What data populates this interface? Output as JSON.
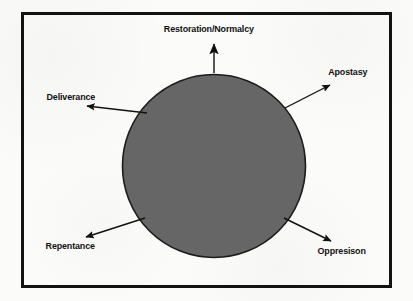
{
  "figure": {
    "type": "cycle-diagram",
    "center_shape": {
      "name": "central-circle",
      "shape": "circle",
      "fill_color": "#666666",
      "stroke_color": "#1a1a1a",
      "center_x": 214,
      "center_y": 166,
      "radius": 92
    },
    "frame": {
      "border_color": "#121212",
      "background_color": "#fbfbf9"
    },
    "arrows": [
      {
        "id": "restoration",
        "label": "Restoration/Normalcy",
        "direction": "up",
        "angle_deg": 90,
        "x1": 214,
        "y1": 72,
        "x2": 214,
        "y2": 41
      },
      {
        "id": "apostasy",
        "label": "Apostasy",
        "direction": "up-right",
        "angle_deg": 40,
        "x1": 286,
        "y1": 107,
        "x2": 333,
        "y2": 83
      },
      {
        "id": "oppresison",
        "label": "Oppresison",
        "direction": "down-right",
        "angle_deg": -40,
        "x1": 285,
        "y1": 219,
        "x2": 334,
        "y2": 243
      },
      {
        "id": "repentance",
        "label": "Repentance",
        "direction": "down-left",
        "angle_deg": -140,
        "x1": 143,
        "y1": 219,
        "x2": 83,
        "y2": 238
      },
      {
        "id": "deliverance",
        "label": "Deliverance",
        "direction": "up-left",
        "angle_deg": 140,
        "x1": 145,
        "y1": 112,
        "x2": 84,
        "y2": 105
      }
    ]
  },
  "labels": {
    "restoration": "Restoration/Normalcy",
    "apostasy": "Apostasy",
    "oppresison": "Oppresison",
    "repentance": "Repentance",
    "deliverance": "Deliverance"
  }
}
